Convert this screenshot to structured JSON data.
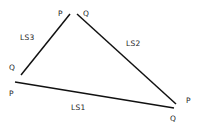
{
  "diagram": {
    "width": 201,
    "height": 127,
    "background": "#ffffff",
    "line_color": "#111111",
    "text_color": "#222222",
    "segments": [
      {
        "id": "LS1",
        "label": "LS1",
        "start": {
          "name": "P",
          "x": 15,
          "y": 82
        },
        "end": {
          "name": "Q",
          "x": 174,
          "y": 108
        },
        "label_pos": {
          "x": 71,
          "y": 110
        },
        "start_label_pos": {
          "x": 9,
          "y": 96
        },
        "end_label_pos": {
          "x": 170,
          "y": 121
        }
      },
      {
        "id": "LS2",
        "label": "LS2",
        "start": {
          "name": "Q",
          "x": 77,
          "y": 14
        },
        "end": {
          "name": "P",
          "x": 176,
          "y": 104
        },
        "label_pos": {
          "x": 126,
          "y": 46
        },
        "start_label_pos": {
          "x": 83,
          "y": 16
        },
        "end_label_pos": {
          "x": 186,
          "y": 103
        }
      },
      {
        "id": "LS3",
        "label": "LS3",
        "start": {
          "name": "Q",
          "x": 21,
          "y": 75
        },
        "end": {
          "name": "P",
          "x": 70,
          "y": 14
        },
        "label_pos": {
          "x": 20,
          "y": 40
        },
        "start_label_pos": {
          "x": 9,
          "y": 70
        },
        "end_label_pos": {
          "x": 58,
          "y": 16
        }
      }
    ]
  }
}
